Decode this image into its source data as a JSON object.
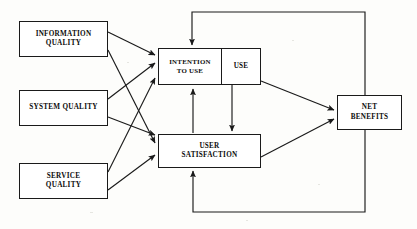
{
  "diagram": {
    "canvas": {
      "width": 417,
      "height": 229,
      "background": "#fdfdfb"
    },
    "line_color": "#1a1a1a",
    "text_color": "#0d0d0d",
    "nodes": [
      {
        "id": "information-quality",
        "label": "INFORMATION\nQUALITY",
        "x": 19,
        "y": 21,
        "w": 89,
        "h": 36
      },
      {
        "id": "system-quality",
        "label": "SYSTEM QUALITY",
        "x": 19,
        "y": 90,
        "w": 89,
        "h": 36
      },
      {
        "id": "service-quality",
        "label": "SERVICE\nQUALITY",
        "x": 19,
        "y": 163,
        "w": 89,
        "h": 36
      },
      {
        "id": "intention-to-use",
        "label": "INTENTION\nTO USE",
        "x": 158,
        "y": 48,
        "w": 64,
        "h": 37
      },
      {
        "id": "use",
        "label": "USE",
        "x": 222,
        "y": 48,
        "w": 39,
        "h": 37
      },
      {
        "id": "user-satisfaction",
        "label": "USER\nSATISFACTION",
        "x": 158,
        "y": 134,
        "w": 103,
        "h": 34
      },
      {
        "id": "net-benefits",
        "label": "NET\nBENEFITS",
        "x": 337,
        "y": 95,
        "w": 65,
        "h": 35
      }
    ],
    "edges": [
      {
        "id": "information-quality-to-intention-to-use",
        "from": "information-quality",
        "to": "intention-to-use"
      },
      {
        "id": "information-quality-to-user-satisfaction",
        "from": "information-quality",
        "to": "user-satisfaction"
      },
      {
        "id": "system-quality-to-intention-to-use",
        "from": "system-quality",
        "to": "intention-to-use"
      },
      {
        "id": "system-quality-to-user-satisfaction",
        "from": "system-quality",
        "to": "user-satisfaction"
      },
      {
        "id": "service-quality-to-intention-to-use",
        "from": "service-quality",
        "to": "intention-to-use"
      },
      {
        "id": "service-quality-to-user-satisfaction",
        "from": "service-quality",
        "to": "user-satisfaction"
      },
      {
        "id": "user-satisfaction-to-intention-to-use",
        "from": "user-satisfaction",
        "to": "intention-to-use"
      },
      {
        "id": "use-to-user-satisfaction",
        "from": "use",
        "to": "user-satisfaction"
      },
      {
        "id": "use-to-net-benefits",
        "from": "use",
        "to": "net-benefits"
      },
      {
        "id": "user-satisfaction-to-net-benefits",
        "from": "user-satisfaction",
        "to": "net-benefits"
      },
      {
        "id": "net-benefits-feedback-to-intention-to-use",
        "from": "net-benefits",
        "to": "intention-to-use"
      },
      {
        "id": "net-benefits-feedback-to-user-satisfaction",
        "from": "net-benefits",
        "to": "user-satisfaction"
      }
    ]
  }
}
